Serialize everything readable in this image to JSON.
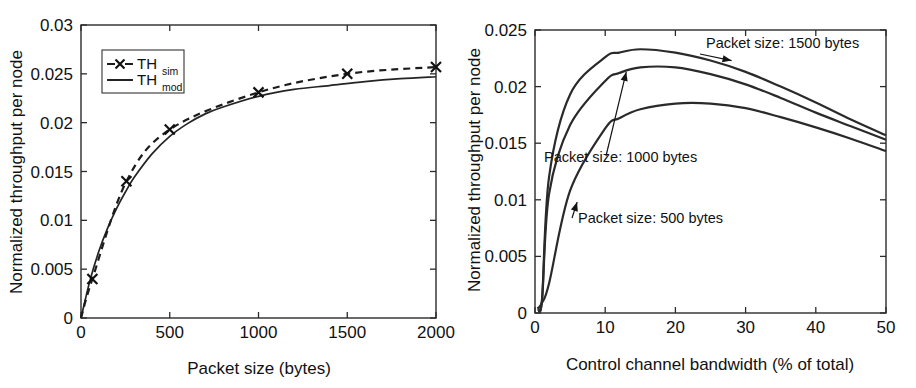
{
  "figure": {
    "background": "#ffffff",
    "ink_color": "#222222",
    "panels": [
      "left",
      "right"
    ]
  },
  "chart_data": [
    {
      "id": "left",
      "type": "line",
      "title": "",
      "xlabel": "Packet size (bytes)",
      "ylabel": "Normalized throughput per node",
      "xlim": [
        0,
        2000
      ],
      "ylim": [
        0,
        0.03
      ],
      "xticks": [
        0,
        500,
        1000,
        1500,
        2000
      ],
      "xticklabels": [
        "0",
        "500",
        "1000",
        "1500",
        "2000"
      ],
      "yticks": [
        0,
        0.005,
        0.01,
        0.015,
        0.02,
        0.025,
        0.03
      ],
      "yticklabels": [
        "0",
        "0.005",
        "0.01",
        "0.015",
        "0.02",
        "0.025",
        "0.03"
      ],
      "grid": false,
      "legend": {
        "position": "upper-left-inside",
        "entries": [
          {
            "base": "TH",
            "sub": "sim",
            "style": "dashed-with-x-markers"
          },
          {
            "base": "TH",
            "sub": "mod",
            "style": "solid"
          }
        ]
      },
      "series": [
        {
          "name": "TH_sim",
          "label_base": "TH",
          "label_sub": "sim",
          "style": "dashed",
          "marker": "x",
          "x": [
            64,
            256,
            500,
            1000,
            1500,
            2000
          ],
          "values": [
            0.004,
            0.014,
            0.0193,
            0.0231,
            0.025,
            0.0257
          ]
        },
        {
          "name": "TH_mod",
          "label_base": "TH",
          "label_sub": "mod",
          "style": "solid",
          "marker": "none",
          "x": [
            0,
            50,
            100,
            150,
            200,
            250,
            300,
            400,
            500,
            600,
            700,
            800,
            1000,
            1200,
            1400,
            1600,
            1800,
            2000
          ],
          "values": [
            0.0,
            0.0038,
            0.0068,
            0.0092,
            0.0112,
            0.0129,
            0.0144,
            0.0168,
            0.0186,
            0.0199,
            0.0209,
            0.0216,
            0.0227,
            0.0234,
            0.0238,
            0.0242,
            0.0245,
            0.0247
          ]
        }
      ]
    },
    {
      "id": "right",
      "type": "line",
      "title": "",
      "xlabel": "Control channel bandwidth (% of total)",
      "ylabel": "Normalized throughput per node",
      "xlim": [
        0,
        50
      ],
      "ylim": [
        0,
        0.025
      ],
      "xticks": [
        0,
        10,
        20,
        30,
        40,
        50
      ],
      "xticklabels": [
        "0",
        "10",
        "20",
        "30",
        "40",
        "50"
      ],
      "yticks": [
        0,
        0.005,
        0.01,
        0.015,
        0.02,
        0.025
      ],
      "yticklabels": [
        "0",
        "0.005",
        "0.01",
        "0.015",
        "0.02",
        "0.025"
      ],
      "grid": false,
      "legend": {
        "position": "none",
        "entries": []
      },
      "annotations": [
        {
          "text": "Packet size: 1500 bytes",
          "target_x": 28,
          "target_y": 0.0223
        },
        {
          "text": "Packet size: 1000 bytes",
          "target_x": 13,
          "target_y": 0.0213
        },
        {
          "text": "Packet size: 500 bytes",
          "target_x": 6.0,
          "target_y": 0.0098
        }
      ],
      "series": [
        {
          "name": "Packet size: 1500 bytes",
          "style": "solid",
          "x": [
            1,
            2,
            5,
            10,
            12,
            15,
            20,
            25,
            30,
            35,
            40,
            45,
            50
          ],
          "values": [
            0.0012,
            0.012,
            0.0193,
            0.0226,
            0.023,
            0.0233,
            0.023,
            0.0223,
            0.0213,
            0.02,
            0.0186,
            0.0171,
            0.0157
          ]
        },
        {
          "name": "Packet size: 1000 bytes",
          "style": "solid",
          "x": [
            1,
            2,
            5,
            10,
            12,
            15,
            20,
            25,
            30,
            35,
            40,
            45,
            50
          ],
          "values": [
            0.0011,
            0.0105,
            0.0166,
            0.0205,
            0.0212,
            0.0217,
            0.0217,
            0.0211,
            0.0202,
            0.019,
            0.0177,
            0.0165,
            0.0153
          ]
        },
        {
          "name": "Packet size: 500 bytes",
          "style": "solid",
          "x": [
            1,
            2,
            5,
            10,
            12,
            15,
            20,
            25,
            30,
            35,
            40,
            45,
            50
          ],
          "values": [
            0.0009,
            0.0026,
            0.0108,
            0.0163,
            0.0172,
            0.018,
            0.0185,
            0.0185,
            0.0181,
            0.0173,
            0.0164,
            0.0154,
            0.0143
          ]
        }
      ]
    }
  ]
}
